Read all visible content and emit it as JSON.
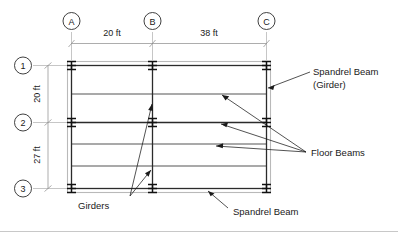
{
  "diagram": {
    "grid": {
      "column_lines": [
        {
          "id": "A",
          "label": "A"
        },
        {
          "id": "B",
          "label": "B"
        },
        {
          "id": "C",
          "label": "C"
        }
      ],
      "row_lines": [
        {
          "id": "1",
          "label": "1"
        },
        {
          "id": "2",
          "label": "2"
        },
        {
          "id": "3",
          "label": "3"
        }
      ]
    },
    "dimensions": {
      "horizontal": [
        {
          "from": "A",
          "to": "B",
          "label": "20 ft"
        },
        {
          "from": "B",
          "to": "C",
          "label": "38 ft"
        }
      ],
      "vertical": [
        {
          "from": "1",
          "to": "2",
          "label": "20 ft"
        },
        {
          "from": "2",
          "to": "3",
          "label": "27 ft"
        }
      ]
    },
    "annotations": [
      {
        "id": "spandrel-girder",
        "line1": "Spandrel Beam",
        "line2": "(Girder)"
      },
      {
        "id": "floor-beams",
        "line1": "Floor Beams"
      },
      {
        "id": "girders",
        "line1": "Girders"
      },
      {
        "id": "spandrel-beam",
        "line1": "Spandrel Beam"
      }
    ],
    "colors": {
      "line": "#2b2b2b",
      "thin_line": "#6e6e6e",
      "dimension_line": "#8a8a8a",
      "spandrel_outline": "#b9b9b9",
      "background": "#ffffff"
    }
  }
}
